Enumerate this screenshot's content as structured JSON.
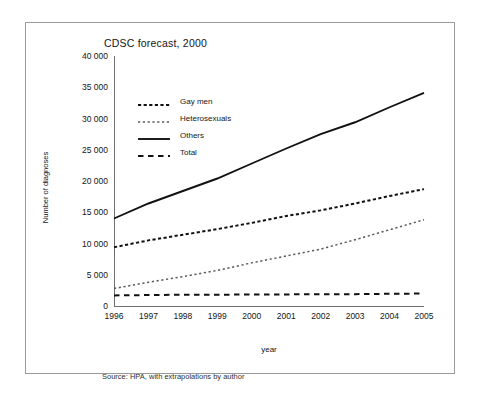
{
  "figure": {
    "title": "CDSC forecast, 2000",
    "source_note": "Source: HPA, with extrapolations by author"
  },
  "chart_data": {
    "type": "line",
    "title": "CDSC forecast, 2000",
    "xlabel": "year",
    "ylabel": "Number of diagnoses",
    "categories": [
      "1996",
      "1997",
      "1998",
      "1999",
      "2000",
      "2001",
      "2002",
      "2003",
      "2004",
      "2005"
    ],
    "x": [
      1996,
      1997,
      1998,
      1999,
      2000,
      2001,
      2002,
      2003,
      2004,
      2005
    ],
    "xlim": [
      1996,
      2005
    ],
    "ylim": [
      0,
      40000
    ],
    "ytick_labels": [
      "0",
      "5 000",
      "10 000",
      "15 000",
      "20 000",
      "25 000",
      "30 000",
      "35 000",
      "40 000"
    ],
    "ytick_values": [
      0,
      5000,
      10000,
      15000,
      20000,
      25000,
      30000,
      35000,
      40000
    ],
    "grid": false,
    "legend_position": "upper-left-inside",
    "series": [
      {
        "name": "Gay men",
        "style": "dotted",
        "color": "#111111",
        "values": [
          9400,
          10500,
          11400,
          12300,
          13300,
          14400,
          15300,
          16400,
          17600,
          18700
        ]
      },
      {
        "name": "Heterosexuals",
        "style": "fine-dotted",
        "color": "#5a5a5a",
        "values": [
          2800,
          3800,
          4700,
          5700,
          6900,
          8000,
          9100,
          10600,
          12200,
          13800
        ]
      },
      {
        "name": "Others",
        "style": "solid",
        "color": "#111111",
        "values": [
          14000,
          16400,
          18400,
          20400,
          22800,
          25200,
          27500,
          29400,
          31800,
          34100
        ]
      },
      {
        "name": "Total",
        "style": "dashed",
        "color": "#111111",
        "values": [
          1700,
          1750,
          1800,
          1800,
          1850,
          1850,
          1900,
          1900,
          1950,
          2000
        ]
      }
    ]
  }
}
